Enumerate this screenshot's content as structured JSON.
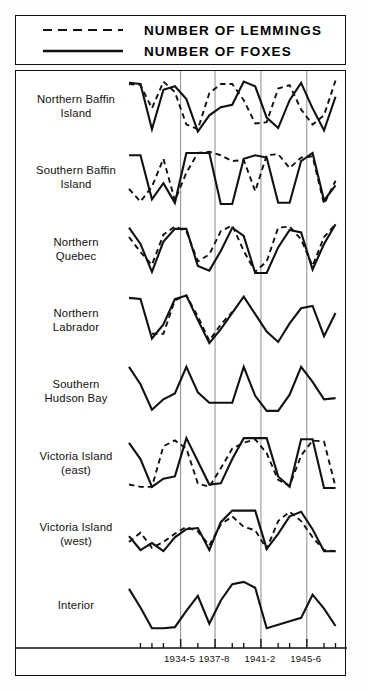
{
  "legend": {
    "entries": [
      {
        "label": "NUMBER OF LEMMINGS",
        "style": "dashed",
        "icon": "dashed-line-icon"
      },
      {
        "label": "NUMBER OF FOXES",
        "style": "solid",
        "icon": "solid-line-icon"
      }
    ]
  },
  "chart_data": {
    "type": "line",
    "title": "",
    "subtitle": "",
    "xlabel": "",
    "ylabel": "",
    "grid": true,
    "legend_position": "top",
    "xlim": [
      1930,
      1949
    ],
    "x_tick_labels": [
      "1934-5",
      "1937-8",
      "1941-2",
      "1945-6"
    ],
    "x_tick_values": [
      1934.5,
      1937.5,
      1941.5,
      1945.5
    ],
    "panels": [
      {
        "name": "Northern Baffin Island",
        "label_lines": [
          "Northern Baffin",
          "Island"
        ],
        "series": [
          {
            "name": "NUMBER OF FOXES",
            "style": "solid",
            "x": [
              1930.0,
              1931.0,
              1932.0,
              1933.0,
              1934.0,
              1935.0,
              1936.0,
              1937.0,
              1938.0,
              1939.0,
              1940.0,
              1941.0,
              1942.0,
              1943.0,
              1944.0,
              1945.0,
              1946.0,
              1947.0,
              1948.0
            ],
            "values": [
              90,
              88,
              10,
              78,
              84,
              62,
              6,
              34,
              48,
              52,
              92,
              84,
              30,
              12,
              60,
              90,
              46,
              8,
              66
            ]
          },
          {
            "name": "NUMBER OF LEMMINGS",
            "style": "dashed",
            "x": [
              1930.0,
              1931.0,
              1932.0,
              1933.0,
              1934.0,
              1935.0,
              1936.0,
              1937.0,
              1938.0,
              1939.0,
              1940.0,
              1941.0,
              1942.0,
              1943.0,
              1944.0,
              1945.0,
              1946.0,
              1947.0,
              1948.0
            ],
            "values": [
              88,
              86,
              46,
              92,
              74,
              18,
              10,
              72,
              88,
              88,
              60,
              20,
              22,
              80,
              86,
              44,
              18,
              34,
              94
            ]
          }
        ]
      },
      {
        "name": "Southern Baffin Island",
        "label_lines": [
          "Southern Baffin",
          "Island"
        ],
        "series": [
          {
            "name": "NUMBER OF FOXES",
            "style": "solid",
            "x": [
              1930.0,
              1931.0,
              1932.0,
              1933.0,
              1934.0,
              1935.0,
              1936.0,
              1937.0,
              1938.0,
              1939.0,
              1940.0,
              1941.0,
              1942.0,
              1943.0,
              1944.0,
              1945.0,
              1946.0,
              1947.0,
              1948.0
            ],
            "values": [
              88,
              88,
              12,
              40,
              6,
              92,
              92,
              92,
              4,
              4,
              82,
              88,
              84,
              6,
              6,
              78,
              92,
              10,
              36
            ]
          },
          {
            "name": "NUMBER OF LEMMINGS",
            "style": "dashed",
            "x": [
              1930.0,
              1931.0,
              1932.0,
              1933.0,
              1934.0,
              1935.0,
              1936.0,
              1937.0,
              1938.0,
              1939.0,
              1940.0,
              1941.0,
              1942.0,
              1943.0,
              1944.0,
              1945.0,
              1946.0,
              1947.0,
              1948.0
            ],
            "values": [
              30,
              8,
              34,
              82,
              10,
              58,
              92,
              94,
              88,
              78,
              80,
              26,
              88,
              90,
              66,
              84,
              86,
              4,
              44
            ]
          }
        ]
      },
      {
        "name": "Northern Quebec",
        "label_lines": [
          "Northern",
          "Quebec"
        ],
        "series": [
          {
            "name": "NUMBER OF FOXES",
            "style": "solid",
            "x": [
              1930.0,
              1931.0,
              1932.0,
              1933.0,
              1934.0,
              1935.0,
              1936.0,
              1937.0,
              1938.0,
              1939.0,
              1940.0,
              1941.0,
              1942.0,
              1943.0,
              1944.0,
              1945.0,
              1946.0,
              1947.0,
              1948.0
            ],
            "values": [
              86,
              58,
              10,
              62,
              84,
              84,
              20,
              12,
              46,
              86,
              72,
              8,
              8,
              52,
              82,
              78,
              14,
              58,
              92
            ]
          },
          {
            "name": "NUMBER OF LEMMINGS",
            "style": "dashed",
            "x": [
              1930.0,
              1931.0,
              1932.0,
              1933.0,
              1934.0,
              1935.0,
              1936.0,
              1937.0,
              1938.0,
              1939.0,
              1940.0,
              1941.0,
              1942.0,
              1943.0,
              1944.0,
              1945.0,
              1946.0,
              1947.0,
              1948.0
            ],
            "values": [
              70,
              44,
              22,
              74,
              88,
              80,
              28,
              40,
              80,
              90,
              46,
              10,
              28,
              86,
              88,
              66,
              20,
              70,
              92
            ]
          }
        ]
      },
      {
        "name": "Northern Labrador",
        "label_lines": [
          "Northern",
          "Labrador"
        ],
        "series": [
          {
            "name": "NUMBER OF FOXES",
            "style": "solid",
            "x": [
              1930.0,
              1931.0,
              1932.0,
              1933.0,
              1934.0,
              1935.0,
              1936.0,
              1937.0,
              1938.0,
              1939.0,
              1940.0,
              1941.0,
              1942.0,
              1943.0,
              1944.0,
              1945.0,
              1946.0,
              1947.0,
              1948.0
            ],
            "values": [
              88,
              86,
              18,
              42,
              86,
              92,
              50,
              10,
              34,
              62,
              90,
              60,
              30,
              12,
              44,
              70,
              74,
              22,
              62
            ]
          },
          {
            "name": "NUMBER OF LEMMINGS",
            "style": "dashed",
            "x": [
              1930.0,
              1931.0,
              1932.0,
              1933.0,
              1934.0,
              1935.0,
              1936.0,
              1937.0,
              1938.0,
              1939.0
            ],
            "values": [
              null,
              null,
              26,
              26,
              84,
              92,
              56,
              14,
              42,
              64
            ]
          }
        ]
      },
      {
        "name": "Southern Hudson Bay",
        "label_lines": [
          "Southern",
          "Hudson Bay"
        ],
        "series": [
          {
            "name": "NUMBER OF FOXES",
            "style": "solid",
            "x": [
              1930.0,
              1931.0,
              1932.0,
              1933.0,
              1934.0,
              1935.0,
              1936.0,
              1937.0,
              1938.0,
              1939.0,
              1940.0,
              1941.0,
              1942.0,
              1943.0,
              1944.0,
              1945.0,
              1946.0,
              1947.0,
              1948.0
            ],
            "values": [
              92,
              62,
              18,
              36,
              46,
              92,
              48,
              30,
              30,
              30,
              92,
              42,
              16,
              16,
              44,
              92,
              66,
              36,
              38
            ]
          }
        ]
      },
      {
        "name": "Victoria Island (east)",
        "label_lines": [
          "Victoria Island",
          "(east)"
        ],
        "series": [
          {
            "name": "NUMBER OF FOXES",
            "style": "solid",
            "x": [
              1930.0,
              1931.0,
              1932.0,
              1933.0,
              1934.0,
              1935.0,
              1936.0,
              1937.0,
              1938.0,
              1939.0,
              1940.0,
              1941.0,
              1942.0,
              1943.0,
              1944.0,
              1945.0,
              1946.0,
              1947.0,
              1948.0
            ],
            "values": [
              84,
              56,
              8,
              22,
              26,
              92,
              52,
              12,
              14,
              56,
              92,
              92,
              92,
              26,
              8,
              90,
              90,
              6,
              6
            ]
          },
          {
            "name": "NUMBER OF LEMMINGS",
            "style": "dashed",
            "x": [
              1930.0,
              1931.0,
              1932.0,
              1933.0,
              1934.0,
              1935.0,
              1936.0,
              1937.0,
              1938.0,
              1939.0,
              1940.0,
              1941.0,
              1942.0,
              1943.0,
              1944.0,
              1945.0,
              1946.0,
              1947.0,
              1948.0
            ],
            "values": [
              12,
              8,
              8,
              78,
              88,
              74,
              14,
              8,
              40,
              74,
              84,
              90,
              66,
              20,
              10,
              62,
              88,
              86,
              8
            ]
          }
        ]
      },
      {
        "name": "Victoria Island (west)",
        "label_lines": [
          "Victoria Island",
          "(west)"
        ],
        "series": [
          {
            "name": "NUMBER OF FOXES",
            "style": "solid",
            "x": [
              1930.0,
              1931.0,
              1932.0,
              1933.0,
              1934.0,
              1935.0,
              1936.0,
              1937.0,
              1938.0,
              1939.0,
              1940.0,
              1941.0,
              1942.0,
              1943.0,
              1944.0,
              1945.0,
              1946.0,
              1947.0,
              1948.0
            ],
            "values": [
              46,
              22,
              34,
              20,
              44,
              58,
              60,
              22,
              70,
              90,
              90,
              90,
              24,
              50,
              80,
              88,
              58,
              20,
              20
            ]
          },
          {
            "name": "NUMBER OF LEMMINGS",
            "style": "dashed",
            "x": [
              1930.0,
              1931.0,
              1932.0,
              1933.0,
              1934.0,
              1935.0,
              1936.0,
              1937.0,
              1938.0,
              1939.0,
              1940.0,
              1941.0,
              1942.0,
              1943.0,
              1944.0,
              1945.0,
              1946.0,
              1947.0,
              1948.0
            ],
            "values": [
              36,
              52,
              26,
              36,
              50,
              62,
              54,
              30,
              66,
              80,
              62,
              56,
              24,
              72,
              88,
              72,
              44,
              22,
              20
            ]
          }
        ]
      },
      {
        "name": "Interior",
        "label_lines": [
          "Interior"
        ],
        "series": [
          {
            "name": "NUMBER OF FOXES",
            "style": "solid",
            "x": [
              1930.0,
              1931.0,
              1932.0,
              1933.0,
              1934.0,
              1935.0,
              1936.0,
              1937.0,
              1938.0,
              1939.0,
              1940.0,
              1941.0,
              1942.0,
              1943.0,
              1944.0,
              1945.0,
              1946.0,
              1947.0,
              1948.0
            ],
            "values": [
              78,
              46,
              10,
              10,
              12,
              40,
              66,
              18,
              58,
              86,
              90,
              80,
              10,
              16,
              22,
              28,
              68,
              44,
              14
            ]
          }
        ]
      }
    ]
  },
  "colors": {
    "ink": "#111111",
    "grid": "#8d8d8d",
    "background": "#ffffff"
  }
}
